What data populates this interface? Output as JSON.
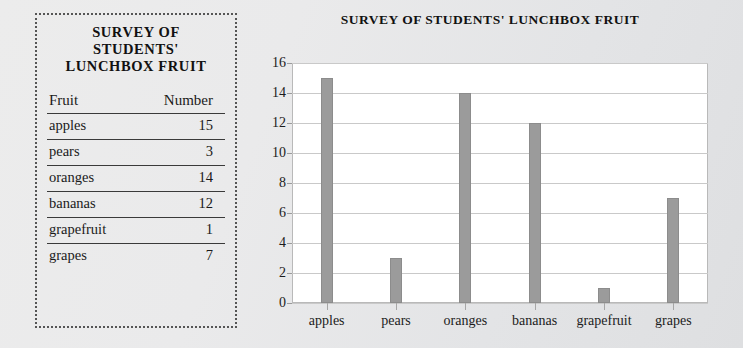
{
  "table": {
    "title": "SURVEY OF STUDENTS' LUNCHBOX FRUIT",
    "title_lines": [
      "SURVEY OF",
      "STUDENTS'",
      "LUNCHBOX FRUIT"
    ],
    "columns": [
      "Fruit",
      "Number"
    ],
    "rows": [
      {
        "fruit": "apples",
        "number": "15"
      },
      {
        "fruit": "pears",
        "number": "3"
      },
      {
        "fruit": "oranges",
        "number": "14"
      },
      {
        "fruit": "bananas",
        "number": "12"
      },
      {
        "fruit": "grapefruit",
        "number": "1"
      },
      {
        "fruit": "grapes",
        "number": "7"
      }
    ]
  },
  "chart_data": {
    "type": "bar",
    "title": "SURVEY OF STUDENTS' LUNCHBOX FRUIT",
    "xlabel": "",
    "ylabel": "",
    "categories": [
      "apples",
      "pears",
      "oranges",
      "bananas",
      "grapefruit",
      "grapes"
    ],
    "values": [
      15,
      3,
      14,
      12,
      1,
      7
    ],
    "ylim": [
      0,
      16
    ],
    "ytick_step": 2,
    "yticks": [
      0,
      2,
      4,
      6,
      8,
      10,
      12,
      14,
      16
    ],
    "grid": true,
    "legend": false,
    "bar_color": "#9b9b9b",
    "plot_background": "#ffffff"
  },
  "colors": {
    "page_background": "#eaeaeb",
    "bar": "#9b9b9b",
    "gridline": "#c9c9c9",
    "text": "#1a1a1a",
    "panel_border": "#555555"
  }
}
